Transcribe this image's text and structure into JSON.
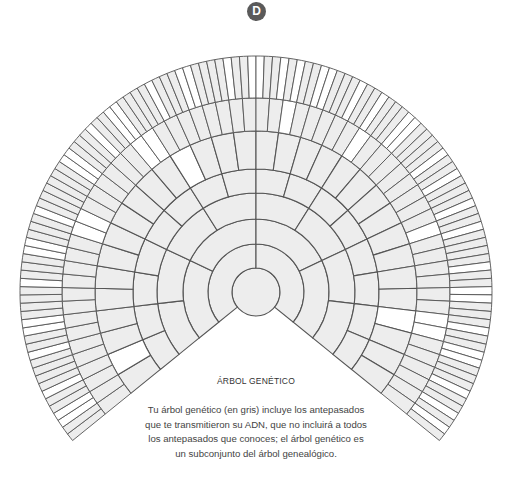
{
  "badge": {
    "letter": "D",
    "color": "#5a5a5a"
  },
  "diagram": {
    "center": [
      256,
      292
    ],
    "radii": [
      24,
      48,
      73,
      99,
      123,
      161,
      194,
      236
    ],
    "start_angle_deg": -39,
    "end_angle_deg": 219,
    "gray_fill": "#ededed",
    "white_fill": "#ffffff",
    "stroke": "#555555",
    "white_cells": {
      "5": [
        1,
        12,
        28
      ],
      "6": [
        14,
        15,
        22,
        23,
        34,
        40,
        49,
        56,
        57
      ],
      "7": [
        2,
        3,
        6,
        11,
        14,
        15,
        20,
        24,
        25,
        29,
        36,
        37,
        41,
        44,
        45,
        50,
        54,
        55,
        60,
        63,
        64,
        67,
        69,
        72,
        73,
        77,
        80,
        84,
        85,
        90,
        93,
        97,
        100,
        105,
        108,
        109,
        113,
        116,
        117,
        121,
        124,
        126
      ]
    }
  },
  "title": "ÁRBOL GENÉTICO",
  "caption_lines": [
    "Tu árbol genético (en gris) incluye los antepasados",
    "que te transmitieron su ADN, que no incluirá a todos",
    "los antepasados que conoces; el árbol genético es",
    "un subconjunto del árbol genealógico."
  ]
}
